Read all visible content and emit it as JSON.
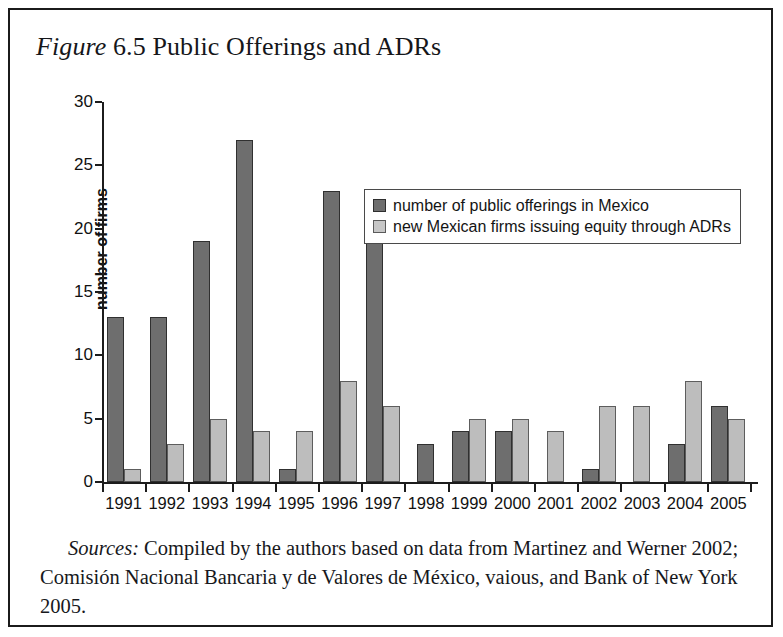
{
  "figure": {
    "label_italic": "Figure",
    "number": "6.5",
    "title": "Public Offerings and ADRs",
    "full_title": "Figure 6.5 Public Offerings and ADRs"
  },
  "legend": {
    "position": "inside-top-center",
    "items": [
      {
        "label": "number of public offerings in Mexico",
        "swatch": "dark",
        "color": "#6e6e6e"
      },
      {
        "label": "new Mexican firms issuing equity through ADRs",
        "swatch": "light",
        "color": "#c6c6c6"
      }
    ]
  },
  "source_note": {
    "label": "Sources:",
    "text": " Compiled by the authors based on data from Martinez and Werner 2002; Comisión Nacional Bancaria y de Valores de México, vaious, and Bank of New York 2005."
  },
  "chart_data": {
    "type": "bar",
    "title": "Figure 6.5 Public Offerings and ADRs",
    "subtitle": "",
    "xlabel": "",
    "ylabel": "number of firms",
    "ylim": [
      0,
      30
    ],
    "yticks": [
      0,
      5,
      10,
      15,
      20,
      25,
      30
    ],
    "grid": false,
    "legend_position": "upper center inside plot",
    "categories": [
      "1991",
      "1992",
      "1993",
      "1994",
      "1995",
      "1996",
      "1997",
      "1998",
      "1999",
      "2000",
      "2001",
      "2002",
      "2003",
      "2004",
      "2005"
    ],
    "series": [
      {
        "name": "number of public offerings in Mexico",
        "color": "#6e6e6e",
        "values": [
          13,
          13,
          19,
          27,
          1,
          23,
          22,
          3,
          4,
          4,
          0,
          1,
          0,
          3,
          6
        ]
      },
      {
        "name": "new Mexican firms issuing equity through ADRs",
        "color": "#c6c6c6",
        "values": [
          1,
          3,
          5,
          4,
          4,
          8,
          6,
          0,
          5,
          5,
          4,
          6,
          6,
          8,
          5
        ]
      }
    ]
  }
}
